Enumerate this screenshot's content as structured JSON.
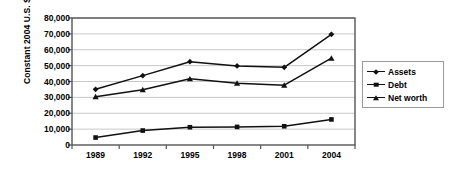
{
  "chart_data": {
    "type": "line",
    "title": "",
    "xlabel": "",
    "ylabel": "Constant 2004 U.S. $",
    "categories": [
      "1989",
      "1992",
      "1995",
      "1998",
      "2001",
      "2004"
    ],
    "series": [
      {
        "name": "Assets",
        "marker": "diamond",
        "values": [
          35100,
          43700,
          52500,
          49800,
          48900,
          69700
        ]
      },
      {
        "name": "Debt",
        "marker": "square",
        "values": [
          4700,
          9100,
          11200,
          11400,
          11800,
          16100
        ]
      },
      {
        "name": "Net worth",
        "marker": "triangle",
        "values": [
          30400,
          34800,
          41700,
          38900,
          37700,
          54700
        ]
      }
    ],
    "ylim": [
      0,
      80000
    ],
    "ytick_values": [
      0,
      10000,
      20000,
      30000,
      40000,
      50000,
      60000,
      70000,
      80000
    ],
    "ytick_labels": [
      "0",
      "10,000",
      "20,000",
      "30,000",
      "40,000",
      "50,000",
      "60,000",
      "70,000",
      "80,000"
    ],
    "grid": "horizontal",
    "legend_position": "right",
    "colors": {
      "line": "#111111",
      "marker": "#111111",
      "gridline": "#c8c8c8",
      "axis": "#555555",
      "background": "#ffffff",
      "legend_border": "#9a9a9a"
    }
  }
}
